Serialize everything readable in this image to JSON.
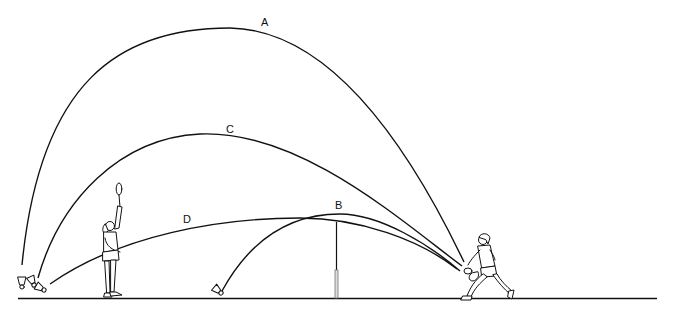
{
  "diagram": {
    "type": "badminton shot trajectories",
    "trajectories": [
      {
        "id": "A",
        "label": "A"
      },
      {
        "id": "B",
        "label": "B"
      },
      {
        "id": "C",
        "label": "C"
      },
      {
        "id": "D",
        "label": "D"
      }
    ],
    "elements": [
      "court-floor",
      "net",
      "receiving-player",
      "hitting-player",
      "shuttlecocks"
    ],
    "colors": {
      "line": "#111111",
      "background": "#ffffff",
      "net-lower": "#999999"
    }
  }
}
